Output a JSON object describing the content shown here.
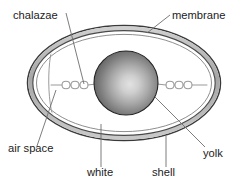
{
  "figure": {
    "background_color": "#ffffff"
  },
  "labels": {
    "chalazae": "chalazae",
    "membrane": "membrane",
    "air_space": "air space",
    "white": "white",
    "shell": "shell",
    "yolk": "yolk"
  },
  "label_positions": {
    "chalazae": {
      "x": 13,
      "y": 19
    },
    "membrane": {
      "x": 172,
      "y": 19
    },
    "air_space": {
      "x": 8,
      "y": 152
    },
    "white": {
      "x": 87,
      "y": 176
    },
    "shell": {
      "x": 152,
      "y": 176
    },
    "yolk": {
      "x": 203,
      "y": 157
    }
  },
  "leader_lines": [
    {
      "name": "chalazae-leader",
      "x1": 66,
      "y1": 13,
      "x2": 84,
      "y2": 84
    },
    {
      "name": "membrane-leader",
      "x1": 170,
      "y1": 15,
      "x2": 147,
      "y2": 33
    },
    {
      "name": "air-space-leader",
      "x1": 37,
      "y1": 146,
      "x2": 56,
      "y2": 90
    },
    {
      "name": "white-leader",
      "x1": 101,
      "y1": 167,
      "x2": 101,
      "y2": 124
    },
    {
      "name": "shell-leader",
      "x1": 166,
      "y1": 167,
      "x2": 166,
      "y2": 136
    },
    {
      "name": "yolk-leader",
      "x1": 205,
      "y1": 147,
      "x2": 155,
      "y2": 97
    }
  ],
  "parts": {
    "shell": {
      "name": "shell",
      "shape": "ellipse",
      "cx": 124,
      "cy": 83,
      "rx": 97,
      "ry": 58,
      "outline_color": "#3a3a3a",
      "band_color": "#b8b8b8"
    },
    "membrane": {
      "name": "membrane",
      "shape": "ellipse",
      "cx": 124,
      "cy": 83,
      "rx": 90,
      "ry": 52,
      "outline_color": "#555555"
    },
    "air_space_boundary": {
      "name": "air-space",
      "description": "inner curve at left end separating air space from white"
    },
    "white": {
      "name": "white",
      "fill_color": "#ffffff"
    },
    "yolk": {
      "name": "yolk",
      "shape": "circle",
      "cx": 126,
      "cy": 83,
      "r": 32,
      "gradient_center_color": "#d6d6d6",
      "gradient_edge_color": "#5f5f5f",
      "outline_color": "#1f1f1f"
    },
    "chalazae": {
      "name": "chalazae",
      "loop_count_left": 3,
      "loop_count_right": 3,
      "stroke_color": "#9a9a9a"
    }
  },
  "colors": {
    "text": "#1c1c1c",
    "leader": "#6d6d6d",
    "shell_outline": "#3a3a3a",
    "shell_band": "#b8b8b8",
    "membrane_line": "#6a6a6a",
    "chalaza": "#9a9a9a"
  }
}
